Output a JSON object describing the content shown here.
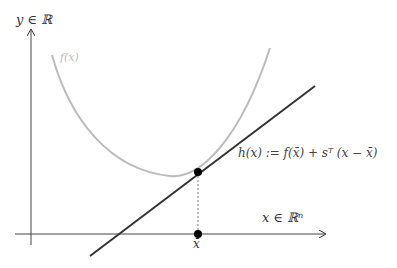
{
  "diagram": {
    "y_axis_label": "y ∈ ℝ",
    "x_axis_label": "x ∈ ℝⁿ",
    "curve_label": "f(x)",
    "tangent_label": "h(x) := f(x̄) + sᵀ (x − x̄)",
    "point_label": "x̄",
    "colors": {
      "axes": "#333333",
      "curve": "#bbbbbb",
      "tangent": "#333333",
      "point": "#000000"
    }
  }
}
